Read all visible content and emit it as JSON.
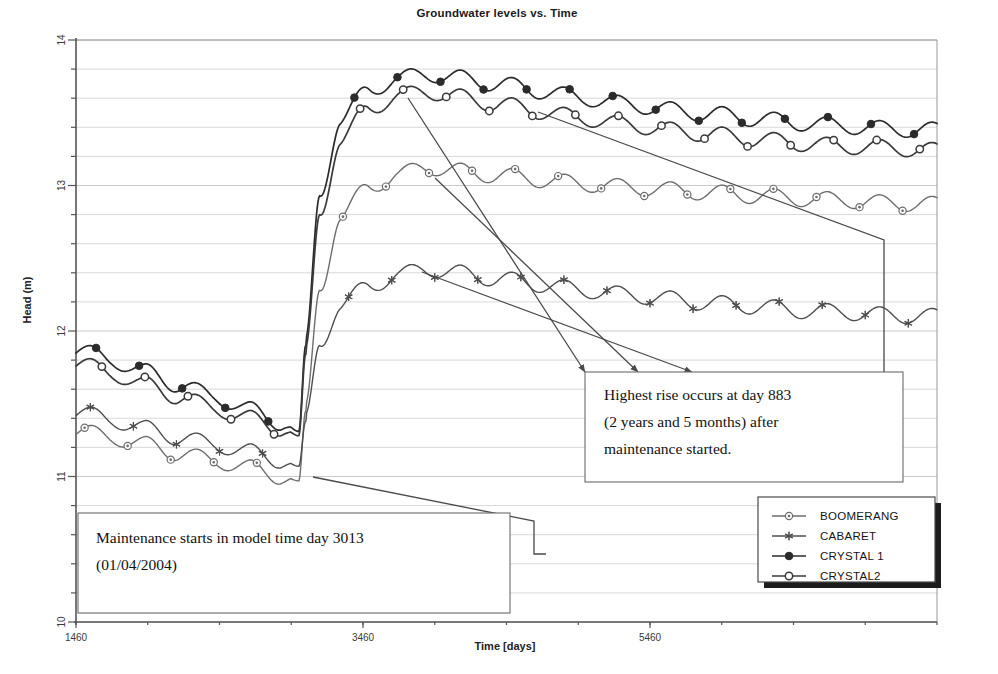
{
  "chart_data": {
    "type": "line",
    "title": "Groundwater levels vs. Time",
    "xlabel": "Time  [days]",
    "ylabel": "Head (m)",
    "xlim": [
      1460,
      7460
    ],
    "ylim": [
      10,
      14
    ],
    "xticks": [
      1460,
      3460,
      5460
    ],
    "xticklabels": [
      "1460",
      "3460",
      "5460"
    ],
    "yticks": [
      10,
      11,
      12,
      13,
      14
    ],
    "yticklabels": [
      "10",
      "11",
      "12",
      "13",
      "14"
    ],
    "grid": "horizontal minor gridlines every 0.2 m",
    "legend_position": "bottom-right",
    "event_day": 3013,
    "peak_day": 3896,
    "series": [
      {
        "name": "BOOMERANG",
        "marker": "circle-dot",
        "color": "#6d6d6d",
        "pre_start": 11.32,
        "pre_end": 10.98,
        "post_peak": 13.13,
        "post_end": 12.87,
        "x": [
          1460,
          1700,
          1940,
          2180,
          2420,
          2660,
          2900,
          3013,
          3060,
          3160,
          3300,
          3500,
          3700,
          3896,
          4100,
          4400,
          4700,
          5000,
          5300,
          5600,
          5900,
          6200,
          6500,
          6800,
          7100,
          7460
        ],
        "y": [
          11.32,
          11.27,
          11.22,
          11.16,
          11.11,
          11.06,
          11.0,
          10.97,
          11.45,
          12.3,
          12.78,
          12.99,
          13.07,
          13.13,
          13.1,
          13.07,
          13.04,
          13.01,
          12.99,
          12.97,
          12.95,
          12.93,
          12.91,
          12.9,
          12.88,
          12.87
        ]
      },
      {
        "name": "CABARET",
        "marker": "asterisk",
        "color": "#4e4e4e",
        "pre_start": 11.45,
        "pre_end": 11.07,
        "post_peak": 12.43,
        "post_end": 12.1,
        "x": [
          1460,
          1700,
          1940,
          2180,
          2420,
          2660,
          2900,
          3013,
          3060,
          3160,
          3300,
          3500,
          3700,
          3896,
          4100,
          4400,
          4700,
          5000,
          5300,
          5600,
          5900,
          6200,
          6500,
          6800,
          7100,
          7460
        ],
        "y": [
          11.45,
          11.39,
          11.33,
          11.27,
          11.22,
          11.17,
          11.11,
          11.07,
          11.38,
          11.92,
          12.17,
          12.31,
          12.38,
          12.43,
          12.4,
          12.36,
          12.32,
          12.28,
          12.25,
          12.22,
          12.19,
          12.17,
          12.14,
          12.13,
          12.11,
          12.1
        ]
      },
      {
        "name": "CRYSTAL 1",
        "marker": "filled-circle",
        "color": "#2b2b2b",
        "pre_start": 11.88,
        "pre_end": 11.3,
        "post_peak": 13.77,
        "post_end": 13.38,
        "x": [
          1460,
          1700,
          1940,
          2180,
          2420,
          2660,
          2900,
          3013,
          3060,
          3160,
          3300,
          3500,
          3700,
          3896,
          4100,
          4400,
          4700,
          5000,
          5300,
          5600,
          5900,
          6200,
          6500,
          6800,
          7100,
          7460
        ],
        "y": [
          11.88,
          11.8,
          11.72,
          11.63,
          11.55,
          11.46,
          11.37,
          11.31,
          11.9,
          12.95,
          13.44,
          13.66,
          13.73,
          13.77,
          13.74,
          13.7,
          13.65,
          13.6,
          13.56,
          13.52,
          13.49,
          13.46,
          13.43,
          13.41,
          13.39,
          13.38
        ]
      },
      {
        "name": "CRYSTAL2",
        "marker": "open-circle",
        "color": "#3a3a3a",
        "pre_start": 11.79,
        "pre_end": 11.28,
        "post_peak": 13.65,
        "post_end": 13.24,
        "x": [
          1460,
          1700,
          1940,
          2180,
          2420,
          2660,
          2900,
          3013,
          3060,
          3160,
          3300,
          3500,
          3700,
          3896,
          4100,
          4400,
          4700,
          5000,
          5300,
          5600,
          5900,
          6200,
          6500,
          6800,
          7100,
          7460
        ],
        "y": [
          11.79,
          11.71,
          11.63,
          11.55,
          11.47,
          11.4,
          11.33,
          11.28,
          11.84,
          12.82,
          13.3,
          13.53,
          13.61,
          13.65,
          13.61,
          13.56,
          13.51,
          13.46,
          13.42,
          13.38,
          13.35,
          13.32,
          13.29,
          13.27,
          13.26,
          13.24
        ]
      }
    ]
  },
  "legend": {
    "items": [
      {
        "label": "BOOMERANG",
        "marker": "circle-dot"
      },
      {
        "label": "CABARET",
        "marker": "asterisk"
      },
      {
        "label": "CRYSTAL 1",
        "marker": "filled-circle"
      },
      {
        "label": "CRYSTAL2",
        "marker": "open-circle"
      }
    ]
  },
  "annotations": {
    "peak": {
      "line1": "Highest rise occurs at day 883",
      "line2": "(2 years and 5 months) after",
      "line3": "maintenance started."
    },
    "maintenance": {
      "line1": "Maintenance starts in model time day 3013",
      "line2": "(01/04/2004)"
    }
  }
}
